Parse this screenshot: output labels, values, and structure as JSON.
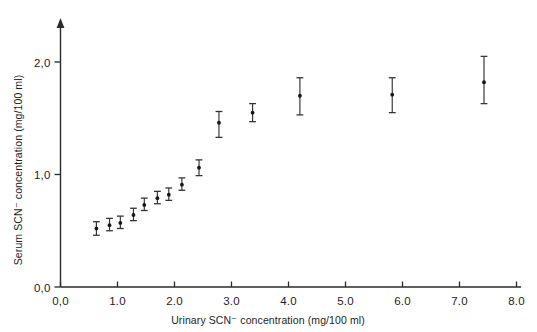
{
  "chart_data": {
    "type": "scatter",
    "title": "",
    "xlabel": "Urinary SCN⁻ concentration (mg/100 ml)",
    "ylabel": "Serum SCN⁻ concentration (mg/100 ml)",
    "xlim": [
      0.0,
      8.0
    ],
    "ylim": [
      0.0,
      2.25
    ],
    "grid": false,
    "legend": null,
    "xticks": [
      "0,0",
      "1.0",
      "2.0",
      "3.0",
      "4.0",
      "5.0",
      "6.0",
      "7.0",
      "8.0"
    ],
    "xtick_values": [
      0.0,
      1.0,
      2.0,
      3.0,
      4.0,
      5.0,
      6.0,
      7.0,
      8.0
    ],
    "yticks": [
      "0,0",
      "1,0",
      "2,0"
    ],
    "ytick_values": [
      0.0,
      1.0,
      2.0
    ],
    "series": [
      {
        "name": "Serum vs urinary thiocyanate",
        "marker": "dot-with-error-bars",
        "points": [
          {
            "x": 0.63,
            "y": 0.52,
            "yerr_low": 0.46,
            "yerr_high": 0.58
          },
          {
            "x": 0.86,
            "y": 0.55,
            "yerr_low": 0.5,
            "yerr_high": 0.61
          },
          {
            "x": 1.05,
            "y": 0.57,
            "yerr_low": 0.52,
            "yerr_high": 0.63
          },
          {
            "x": 1.28,
            "y": 0.64,
            "yerr_low": 0.59,
            "yerr_high": 0.7
          },
          {
            "x": 1.47,
            "y": 0.73,
            "yerr_low": 0.68,
            "yerr_high": 0.79
          },
          {
            "x": 1.7,
            "y": 0.79,
            "yerr_low": 0.74,
            "yerr_high": 0.85
          },
          {
            "x": 1.9,
            "y": 0.82,
            "yerr_low": 0.77,
            "yerr_high": 0.88
          },
          {
            "x": 2.13,
            "y": 0.91,
            "yerr_low": 0.86,
            "yerr_high": 0.97
          },
          {
            "x": 2.43,
            "y": 1.06,
            "yerr_low": 0.99,
            "yerr_high": 1.13
          },
          {
            "x": 2.78,
            "y": 1.46,
            "yerr_low": 1.33,
            "yerr_high": 1.56
          },
          {
            "x": 3.37,
            "y": 1.55,
            "yerr_low": 1.47,
            "yerr_high": 1.63
          },
          {
            "x": 4.2,
            "y": 1.7,
            "yerr_low": 1.53,
            "yerr_high": 1.86
          },
          {
            "x": 5.82,
            "y": 1.71,
            "yerr_low": 1.55,
            "yerr_high": 1.86
          },
          {
            "x": 7.43,
            "y": 1.82,
            "yerr_low": 1.63,
            "yerr_high": 2.05
          }
        ]
      }
    ]
  },
  "colors": {
    "background": "#ffffff",
    "axis": "#2a2a2a",
    "marker": "#161616",
    "errorbar": "#333333"
  }
}
